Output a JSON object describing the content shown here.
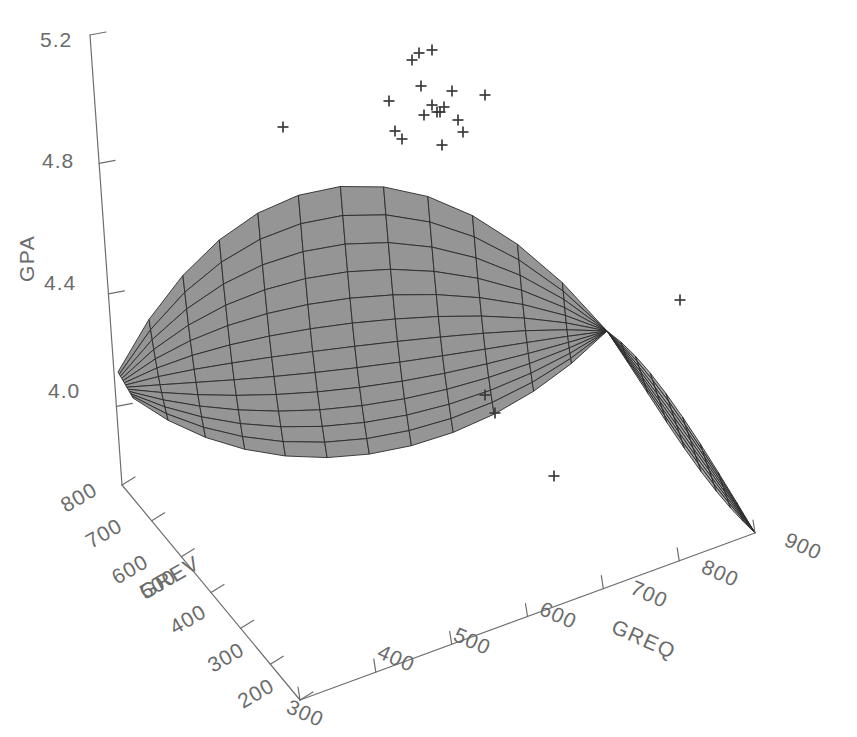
{
  "chart_data": {
    "type": "scatter",
    "title": "",
    "subtitle": "",
    "projection": "3d-surface-with-scatter",
    "axes": {
      "z": {
        "label": "GPA",
        "ticks": [
          "5.2",
          "4.8",
          "4.4",
          "4.0"
        ],
        "tick_values": [
          5.2,
          4.8,
          4.4,
          4.0
        ],
        "range": [
          4.0,
          5.2
        ]
      },
      "x_left": {
        "label": "GREV",
        "ticks": [
          "800",
          "700",
          "600",
          "500",
          "400",
          "300",
          "200"
        ],
        "tick_values": [
          800,
          700,
          600,
          500,
          400,
          300,
          200
        ],
        "range": [
          200,
          800
        ]
      },
      "x_right": {
        "label": "GREQ",
        "ticks": [
          "300",
          "400",
          "500",
          "600",
          "700",
          "800",
          "900"
        ],
        "tick_values": [
          300,
          400,
          500,
          600,
          700,
          800,
          900
        ],
        "range": [
          300,
          900
        ]
      }
    },
    "grid": false,
    "legend": null,
    "surface": {
      "fill_color": "#8f8f8f",
      "line_color": "#2b2b2b",
      "u_divisions": 12,
      "v_divisions": 12,
      "shape": "saddle-dome pinching to a narrow waist at high GREQ then fanning downward"
    },
    "marker": {
      "symbol": "plus",
      "color": "#3a3a3a",
      "count": 21
    },
    "scatter_points_px": [
      [
        283,
        127
      ],
      [
        389,
        101
      ],
      [
        395,
        131
      ],
      [
        402,
        139
      ],
      [
        412,
        60
      ],
      [
        419,
        53
      ],
      [
        421,
        86
      ],
      [
        424,
        115
      ],
      [
        432,
        50
      ],
      [
        432,
        105
      ],
      [
        437,
        112
      ],
      [
        440,
        112
      ],
      [
        442,
        145
      ],
      [
        444,
        107
      ],
      [
        452,
        91
      ],
      [
        458,
        120
      ],
      [
        463,
        132
      ],
      [
        485,
        95
      ],
      [
        485,
        395
      ],
      [
        495,
        413
      ],
      [
        554,
        476
      ],
      [
        680,
        300
      ]
    ]
  },
  "axis_labels": {
    "z_title": "GPA",
    "left_title": "GREV",
    "right_title": "GREQ"
  },
  "z_ticks": [
    {
      "text": "5.2",
      "x": 40,
      "y": 47
    },
    {
      "text": "4.8",
      "x": 42,
      "y": 168
    },
    {
      "text": "4.4",
      "x": 44,
      "y": 290
    },
    {
      "text": "4.0",
      "x": 48,
      "y": 398
    }
  ],
  "grev_ticks": [
    {
      "text": "800",
      "x": 66,
      "y": 513,
      "rot": -30
    },
    {
      "text": "700",
      "x": 91,
      "y": 549,
      "rot": -30
    },
    {
      "text": "600",
      "x": 117,
      "y": 585,
      "rot": -30
    },
    {
      "text": "500",
      "x": 145,
      "y": 600,
      "rot": -30
    },
    {
      "text": "400",
      "x": 175,
      "y": 635,
      "rot": -30
    },
    {
      "text": "300",
      "x": 213,
      "y": 673,
      "rot": -30
    },
    {
      "text": "200",
      "x": 243,
      "y": 709,
      "rot": -30
    }
  ],
  "greq_ticks": [
    {
      "text": "300",
      "x": 285,
      "y": 712,
      "rot": 24
    },
    {
      "text": "400",
      "x": 376,
      "y": 657,
      "rot": 24
    },
    {
      "text": "500",
      "x": 452,
      "y": 640,
      "rot": 24
    },
    {
      "text": "600",
      "x": 538,
      "y": 614,
      "rot": 24
    },
    {
      "text": "700",
      "x": 629,
      "y": 593,
      "rot": 24
    },
    {
      "text": "800",
      "x": 700,
      "y": 572,
      "rot": 24
    },
    {
      "text": "900",
      "x": 783,
      "y": 545,
      "rot": 24
    }
  ],
  "axis_titles_pos": {
    "z": {
      "x": 34,
      "y": 282
    },
    "grev": {
      "x": 145,
      "y": 600
    },
    "greq": {
      "x": 610,
      "y": 632
    }
  }
}
